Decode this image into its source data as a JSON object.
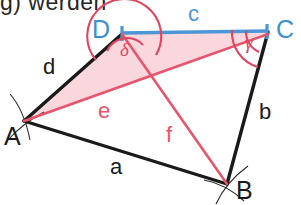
{
  "figure": {
    "title_fragment": "g) werden",
    "type": "quadrilateral-construction",
    "vertices": [
      {
        "name": "A",
        "label": "A",
        "x": 24,
        "y": 121,
        "label_x": 6,
        "label_y": 126,
        "color": "#1a1a1a"
      },
      {
        "name": "B",
        "label": "B",
        "x": 227,
        "y": 184,
        "label_x": 235,
        "label_y": 180,
        "color": "#1a1a1a"
      },
      {
        "name": "C",
        "label": "C",
        "x": 268,
        "y": 32,
        "label_x": 275,
        "label_y": 20,
        "color": "#3d8fd1"
      },
      {
        "name": "D",
        "label": "D",
        "x": 122,
        "y": 34,
        "label_x": 92,
        "label_y": 22,
        "color": "#3d8fd1"
      }
    ],
    "sides": [
      {
        "name": "a",
        "label": "a",
        "from": "A",
        "to": "B",
        "color": "#1a1a1a",
        "label_x": 110,
        "label_y": 158
      },
      {
        "name": "b",
        "label": "b",
        "from": "B",
        "to": "C",
        "color": "#1a1a1a",
        "label_x": 259,
        "label_y": 103
      },
      {
        "name": "c",
        "label": "c",
        "from": "D",
        "to": "C",
        "color": "#4a96d6",
        "label_x": 188,
        "label_y": 6
      },
      {
        "name": "d",
        "label": "d",
        "from": "A",
        "to": "D",
        "color": "#1a1a1a",
        "label_x": 43,
        "label_y": 58
      }
    ],
    "diagonals": [
      {
        "name": "e",
        "label": "e",
        "from": "A",
        "to": "C",
        "color": "#e8546b",
        "label_x": 98,
        "label_y": 102
      },
      {
        "name": "f",
        "label": "f",
        "from": "D",
        "to": "B",
        "color": "#e8546b",
        "label_x": 166,
        "label_y": 126
      }
    ],
    "angles": [
      {
        "name": "delta",
        "label": "δ",
        "at": "D",
        "color": "#e0455f",
        "label_x": 120,
        "label_y": 42
      },
      {
        "name": "gamma",
        "label": "γ",
        "at": "C",
        "color": "#e0455f",
        "label_x": 245,
        "label_y": 35
      }
    ],
    "shaded_region": {
      "name": "triangle-ADC",
      "vertices": "A,D,C",
      "fill": "#f9d7dd"
    },
    "colors": {
      "black_line": "#1a1a1a",
      "blue_line": "#4a96d6",
      "red_line": "#e8546b",
      "pink_fill": "#f9d7dd",
      "arc_red": "#e0455f",
      "construction_arc": "#2b2b2b"
    }
  }
}
